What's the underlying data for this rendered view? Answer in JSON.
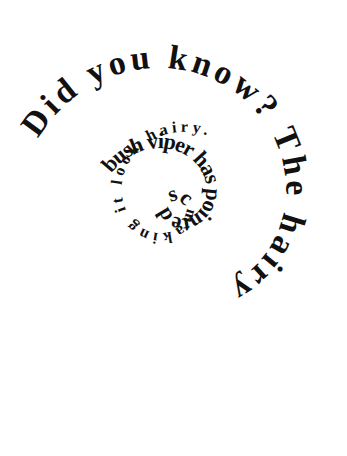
{
  "canvas": {
    "width": 347,
    "height": 456,
    "background_color": "#ffffff",
    "text_color": "#111111"
  },
  "artwork": {
    "kind": "spiral-text",
    "direction": "clockwise-inward",
    "center_x": 172,
    "center_y": 202,
    "full_text": "Did you know? The hairy bush viper has pointed scales with curled tips, making it look hairy.",
    "segments": [
      {
        "label": "headline",
        "text": "Did you know?"
      },
      {
        "label": "fact",
        "text": "The hairy bush viper has pointed scales with curled tips, making it look hairy."
      }
    ],
    "turns": [
      {
        "index": 0,
        "text": "Did you know? The hairy",
        "font_size": 34
      },
      {
        "index": 1,
        "text": "bush viper has pointed scales with curled tips,",
        "font_size": 22
      },
      {
        "index": 2,
        "text": "making it look hairy.",
        "font_size": 16
      }
    ]
  }
}
